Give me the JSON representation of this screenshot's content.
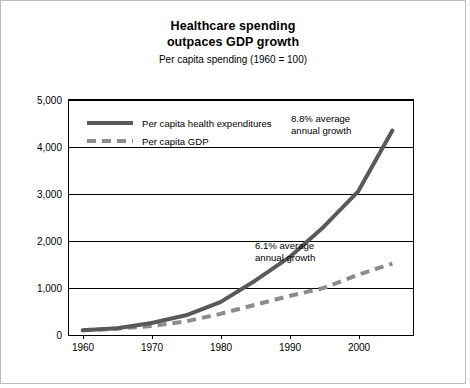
{
  "chart_data": {
    "type": "line",
    "title": "Healthcare spending outpaces GDP growth",
    "title_line1": "Healthcare spending",
    "title_line2": "outpaces GDP growth",
    "subtitle": "Per capita spending (1960 = 100)",
    "xlabel": "",
    "ylabel": "",
    "xlim": [
      1958,
      2008
    ],
    "ylim": [
      0,
      5000
    ],
    "grid": true,
    "legend_position": "top-left inside plot",
    "yticks": [
      0,
      1000,
      2000,
      3000,
      4000,
      5000
    ],
    "ytick_labels": [
      "0",
      "1,000",
      "2,000",
      "3,000",
      "4,000",
      "5,000"
    ],
    "xticks": [
      1960,
      1970,
      1980,
      1990,
      2000
    ],
    "xtick_labels": [
      "1960",
      "1970",
      "1980",
      "1990",
      "2000"
    ],
    "series": [
      {
        "name": "Per capita health expenditures",
        "style": "solid",
        "color": "#595959",
        "x": [
          1960,
          1965,
          1970,
          1975,
          1980,
          1985,
          1990,
          1995,
          2000,
          2005
        ],
        "values": [
          100,
          145,
          255,
          420,
          700,
          1150,
          1650,
          2300,
          3050,
          4350
        ]
      },
      {
        "name": "Per capita GDP",
        "style": "dashed",
        "color": "#8c8c8c",
        "x": [
          1960,
          1965,
          1970,
          1975,
          1980,
          1985,
          1990,
          1995,
          2000,
          2005
        ],
        "values": [
          100,
          135,
          190,
          290,
          450,
          640,
          830,
          1000,
          1280,
          1520
        ]
      }
    ],
    "annotations": [
      {
        "id": "health-growth",
        "line1": "8.8% average",
        "line2": "annual growth"
      },
      {
        "id": "gdp-growth",
        "line1": "6.1% average",
        "line2": "annual growth"
      }
    ]
  },
  "colors": {
    "health_line": "#595959",
    "gdp_line": "#8c8c8c",
    "axis": "#000000",
    "frame": "#bdbdbd",
    "background": "#ffffff"
  }
}
